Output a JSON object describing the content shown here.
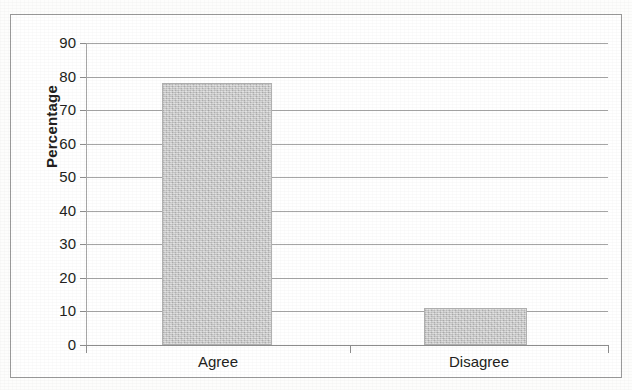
{
  "chart_data": {
    "type": "bar",
    "title": "",
    "subtitle": "",
    "xlabel": "",
    "ylabel": "Percentage",
    "categories": [
      "Agree",
      "Disagree"
    ],
    "values": [
      78,
      11
    ],
    "ylim": [
      0,
      90
    ],
    "ytick_step": 10,
    "ytick_labels": [
      "0",
      "10",
      "20",
      "30",
      "40",
      "50",
      "60",
      "70",
      "80",
      "90"
    ],
    "ytick_values": [
      0,
      10,
      20,
      30,
      40,
      50,
      60,
      70,
      80,
      90
    ],
    "grid": "horizontal",
    "legend": "none",
    "series": [
      {
        "name": "Percentage",
        "values": [
          78,
          11
        ],
        "color": "#c3c3c3"
      }
    ],
    "annotations": []
  },
  "axes": {
    "y_title": "Percentage",
    "y_ticks": [
      {
        "label": "90",
        "value": 90
      },
      {
        "label": "80",
        "value": 80
      },
      {
        "label": "70",
        "value": 70
      },
      {
        "label": "60",
        "value": 60
      },
      {
        "label": "50",
        "value": 50
      },
      {
        "label": "40",
        "value": 40
      },
      {
        "label": "30",
        "value": 30
      },
      {
        "label": "20",
        "value": 20
      },
      {
        "label": "10",
        "value": 10
      },
      {
        "label": "0",
        "value": 0
      }
    ],
    "x_categories": [
      {
        "label": "Agree"
      },
      {
        "label": "Disagree"
      }
    ]
  },
  "colors": {
    "bar_fill": "#c3c3c3",
    "gridline": "#a6a6a6",
    "axis_line": "#8d8d8d",
    "text": "#231f20",
    "border": "#9a9a9a",
    "background": "#ffffff"
  }
}
